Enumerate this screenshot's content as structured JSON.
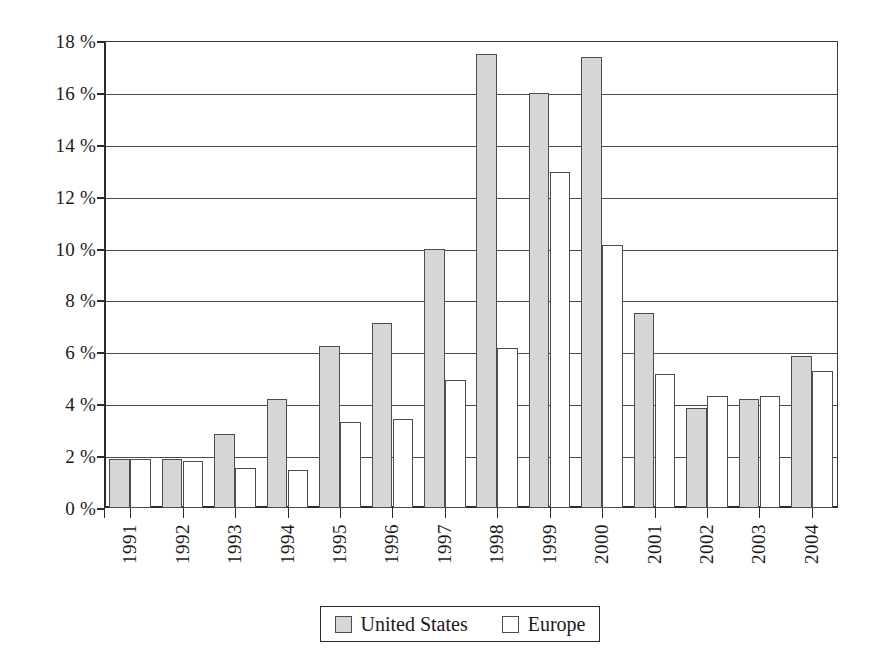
{
  "chart_data": {
    "type": "bar",
    "title": "",
    "subtitle": "",
    "xlabel": "",
    "ylabel": "",
    "categories": [
      "1991",
      "1992",
      "1993",
      "1994",
      "1995",
      "1996",
      "1997",
      "1998",
      "1999",
      "2000",
      "2001",
      "2002",
      "2003",
      "2004"
    ],
    "series": [
      {
        "name": "United States",
        "color": "#d6d6d6",
        "values": [
          1.9,
          1.9,
          2.85,
          4.2,
          6.25,
          7.15,
          10.0,
          17.5,
          16.0,
          17.4,
          7.5,
          3.85,
          4.2,
          5.85
        ]
      },
      {
        "name": "Europe",
        "color": "#ffffff",
        "values": [
          1.9,
          1.8,
          1.55,
          1.45,
          3.3,
          3.45,
          4.95,
          6.15,
          12.95,
          10.15,
          5.15,
          4.3,
          4.3,
          5.3
        ]
      }
    ],
    "ylim": [
      0,
      18
    ],
    "ytick_values": [
      0,
      2,
      4,
      6,
      8,
      10,
      12,
      14,
      16,
      18
    ],
    "ytick_labels": [
      "0 %",
      "2 %",
      "4 %",
      "6 %",
      "8 %",
      "10 %",
      "12 %",
      "14 %",
      "16 %",
      "18 %"
    ],
    "grid": true,
    "legend_position": "bottom-center",
    "legend_entries": [
      "United States",
      "Europe"
    ],
    "unit": "%"
  }
}
